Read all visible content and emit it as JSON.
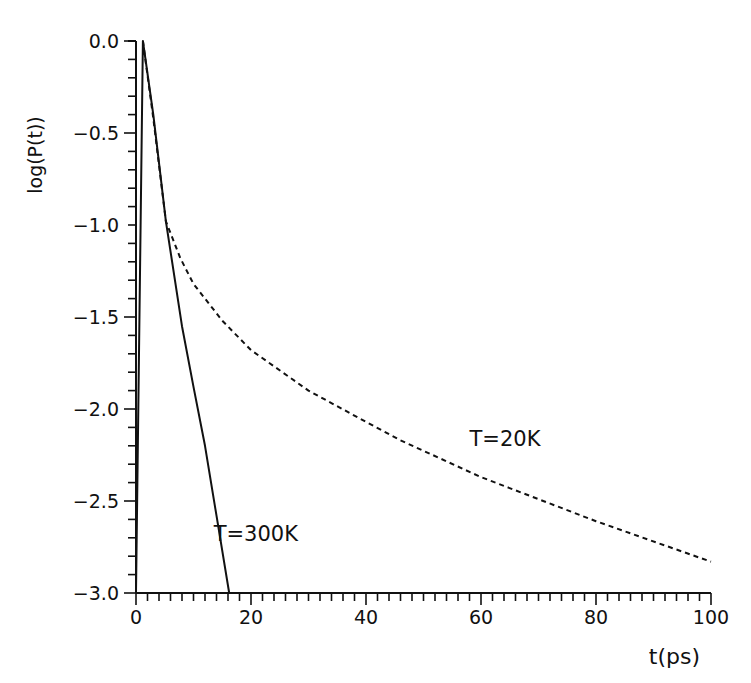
{
  "chart_data": {
    "type": "line",
    "title": "",
    "xlabel": "t(ps)",
    "ylabel": "log(P(t))",
    "xlim": [
      0,
      100
    ],
    "ylim": [
      -3.0,
      0.0
    ],
    "grid": false,
    "legend": "inline annotations",
    "x_ticks": [
      "0",
      "20",
      "40",
      "60",
      "80",
      "100"
    ],
    "y_ticks": [
      "0.0",
      "-0.5",
      "-1.0",
      "-1.5",
      "-2.0",
      "-2.5",
      "-3.0"
    ],
    "x_minor_step": 2,
    "y_minor_step": 0.1,
    "series": [
      {
        "name": "T=300K",
        "style": "solid",
        "x": [
          0,
          1.2,
          3,
          5.2,
          8,
          10,
          12,
          14,
          16.2
        ],
        "y": [
          -3.0,
          0.0,
          -0.4,
          -0.98,
          -1.55,
          -1.88,
          -2.2,
          -2.58,
          -3.0
        ]
      },
      {
        "name": "T=20K",
        "style": "dashed",
        "x": [
          1.2,
          3,
          5.2,
          7.7,
          10,
          15,
          20,
          30,
          40,
          46,
          60,
          80,
          100
        ],
        "y": [
          0.0,
          -0.42,
          -0.98,
          -1.18,
          -1.32,
          -1.52,
          -1.68,
          -1.9,
          -2.07,
          -2.17,
          -2.37,
          -2.61,
          -2.83
        ]
      }
    ],
    "annotations": [
      {
        "text": "T=300K",
        "x": 13.5,
        "y": -2.72
      },
      {
        "text": "T=20K",
        "x": 58,
        "y": -2.2
      }
    ]
  }
}
